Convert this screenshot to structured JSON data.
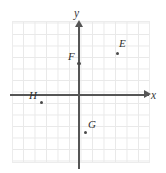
{
  "figure": {
    "type": "coordinate-plane",
    "background_color": "#ffffff",
    "grid_color": "#e9e9e9",
    "axis_color": "#555555",
    "point_color": "#4a4a4a"
  },
  "axes": {
    "x_label": "x",
    "y_label": "y",
    "grid_cell_px": 11.5,
    "origin_px": {
      "x": 79,
      "y": 95
    }
  },
  "chart_data": {
    "type": "scatter",
    "title": "",
    "xlabel": "x",
    "ylabel": "y",
    "grid": true,
    "legend": "none",
    "xlim": [
      -6,
      6
    ],
    "ylim": [
      -6,
      6
    ],
    "points": [
      {
        "name": "E",
        "x": 3.3,
        "y": 3.6
      },
      {
        "name": "F",
        "x": 0,
        "y": 2.8
      },
      {
        "name": "G",
        "x": 0.5,
        "y": -3.2
      },
      {
        "name": "H",
        "x": -3.3,
        "y": -0.6
      }
    ]
  },
  "points": {
    "E": {
      "label": "E",
      "dot_left": 115.6,
      "dot_top": 51.6,
      "label_left": 119,
      "label_top": 38
    },
    "F": {
      "label": "F",
      "dot_left": 77.4,
      "dot_top": 62.0,
      "label_left": 68,
      "label_top": 51
    },
    "G": {
      "label": "G",
      "dot_left": 84.0,
      "dot_top": 131.0,
      "label_left": 88,
      "label_top": 119
    },
    "H": {
      "label": "H",
      "dot_left": 40.0,
      "dot_top": 101.0,
      "label_left": 29,
      "label_top": 90
    }
  }
}
